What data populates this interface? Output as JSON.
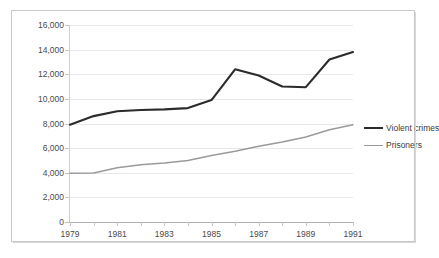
{
  "chart_data": {
    "type": "line",
    "title": "",
    "xlabel": "",
    "ylabel": "",
    "x": [
      1979,
      1980,
      1981,
      1982,
      1983,
      1984,
      1985,
      1986,
      1987,
      1988,
      1989,
      1990,
      1991
    ],
    "xlim": [
      1979,
      1991
    ],
    "ylim": [
      0,
      16000
    ],
    "grid": true,
    "legend_position": "right",
    "ytick_labels": [
      "16,000",
      "14,000",
      "12,000",
      "10,000",
      "8,000",
      "6,000",
      "4,000",
      "2,000",
      "0"
    ],
    "ytick_values": [
      16000,
      14000,
      12000,
      10000,
      8000,
      6000,
      4000,
      2000,
      0
    ],
    "xtick_labels": [
      "1979",
      "1981",
      "1983",
      "1985",
      "1987",
      "1989",
      "1991"
    ],
    "xtick_values": [
      1979,
      1981,
      1983,
      1985,
      1987,
      1989,
      1991
    ],
    "series": [
      {
        "name": "Violent crimes",
        "color": "#2b2b2b",
        "width": 2.1,
        "values": [
          7900,
          8600,
          9000,
          9100,
          9150,
          9250,
          9900,
          12400,
          11900,
          11000,
          10950,
          13200,
          13800
        ]
      },
      {
        "name": "Prisoners",
        "color": "#9a9a9a",
        "width": 1.5,
        "values": [
          3950,
          3980,
          4400,
          4650,
          4800,
          5000,
          5400,
          5750,
          6150,
          6500,
          6900,
          7500,
          7900
        ]
      }
    ]
  },
  "legend": {
    "items": [
      {
        "label": "Violent crimes",
        "color": "#2b2b2b",
        "width": 2.6
      },
      {
        "label": "Prisoners",
        "color": "#9a9a9a",
        "width": 1.6
      }
    ]
  },
  "colors": {
    "gridline": "#e8e8e8",
    "axis": "#c0c0c0",
    "frame": "#c9c9c9",
    "tick_text": "#4a4a4a",
    "background": "#ffffff"
  }
}
